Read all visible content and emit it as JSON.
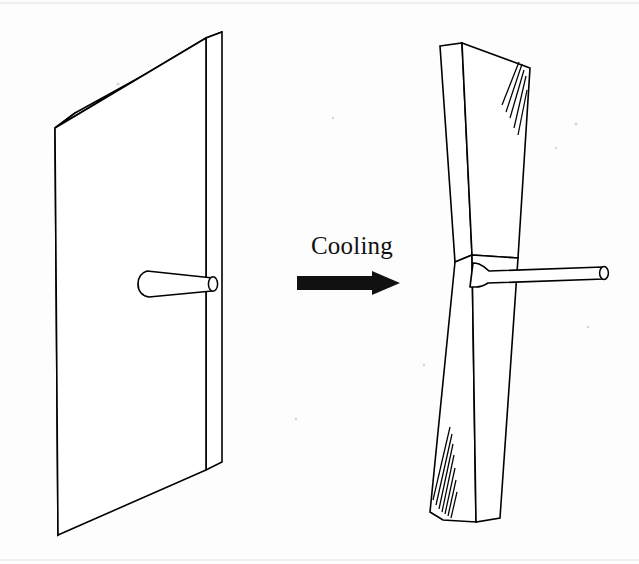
{
  "figure": {
    "background_color": "#fdfdfd",
    "line_color": "#000000",
    "fill_color": "#ffffff"
  },
  "label": {
    "cooling": "Cooling"
  },
  "icons": {
    "arrow": "right-arrow-icon"
  },
  "left_object": {
    "name": "flat-plate",
    "description": "Flat rectangular plate shown in isometric view with a tapered cylindrical pin protruding from its front face",
    "front_face": "55,128 206,38 206,470 58,535",
    "top_face": "55,128 75,113 222,32 206,38",
    "side_face": "206,38 222,32 222,462 206,470",
    "left_edge": "55,128 75,113 75,520 58,535",
    "pin": {
      "name": "tapered-pin",
      "base_x": 142,
      "base_y": 286,
      "tip_x": 218,
      "tip_y": 288
    }
  },
  "right_object": {
    "name": "twisted-plate",
    "description": "Same plate after cooling, twisted about its vertical axis so top and bottom halves rotate in opposite directions, forming an hourglass crossing at mid height",
    "upper_front": "440,46 462,43 472,255 455,262",
    "upper_right": "462,43 530,68 518,258 472,255",
    "lower_front": "455,262 472,255 500,518 476,522",
    "lower_left": "430,512 455,262 476,522 443,520",
    "crossing_x": 464,
    "crossing_y": 258,
    "pin": {
      "name": "tapered-pin",
      "base_x": 478,
      "base_y": 277,
      "tip_x": 608,
      "tip_y": 272
    },
    "hatch_groups": [
      {
        "name": "hatch-upper-right",
        "count": 5
      },
      {
        "name": "hatch-lower-left",
        "count": 7
      }
    ]
  },
  "process_arrow": {
    "name": "cooling-arrow",
    "x_start": 297,
    "x_end": 400,
    "y_center": 283,
    "shaft_height": 14,
    "head_width": 28,
    "head_height": 25,
    "color": "#111111"
  }
}
